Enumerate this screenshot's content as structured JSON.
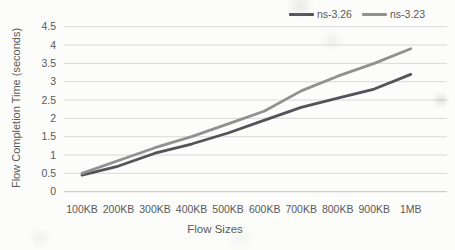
{
  "chart_data": {
    "type": "line",
    "title": "",
    "xlabel": "Flow Sizes",
    "ylabel": "Flow Completion Time (seconds)",
    "categories": [
      "100KB",
      "200KB",
      "300KB",
      "400KB",
      "500KB",
      "600KB",
      "700KB",
      "800KB",
      "900KB",
      "1MB"
    ],
    "series": [
      {
        "name": "ns-3.26",
        "color": "#53535b",
        "values": [
          0.45,
          0.7,
          1.05,
          1.3,
          1.6,
          1.95,
          2.3,
          2.55,
          2.8,
          3.2
        ]
      },
      {
        "name": "ns-3.23",
        "color": "#919191",
        "values": [
          0.5,
          0.85,
          1.2,
          1.5,
          1.85,
          2.2,
          2.75,
          3.15,
          3.5,
          3.9
        ]
      }
    ],
    "y_ticks": [
      "0",
      "0.5",
      "1",
      "1.5",
      "2",
      "2.5",
      "3",
      "3.5",
      "4",
      "4.5"
    ],
    "ylim": [
      0,
      4.5
    ],
    "grid": true,
    "legend_position": "top-right",
    "colors": {
      "text": "#595959",
      "gridline": "#d9d9d9",
      "axis_line": "#c3c3c3",
      "background": "#fcfcfb"
    }
  }
}
